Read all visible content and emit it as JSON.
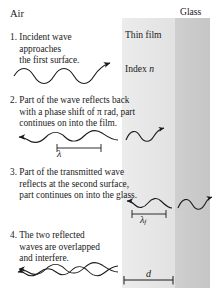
{
  "figure": {
    "title_region": {
      "air_label": "Air",
      "film_label_line1": "Thin film",
      "film_label_line2_prefix": "Index ",
      "film_label_index_symbol": "n",
      "glass_label": "Glass"
    },
    "materials": [
      {
        "name": "air",
        "label": "Air",
        "color": "#ffffff"
      },
      {
        "name": "thin-film",
        "label": "Thin film",
        "color": "#e8e8e8"
      },
      {
        "name": "glass",
        "label": "Glass",
        "color": "#c9c9c9"
      }
    ],
    "steps": [
      {
        "number": "1.",
        "text": "1. Incident wave\n    approaches\n    the first surface."
      },
      {
        "number": "2.",
        "text": "2. Part of the wave reflects back\n    with a phase shift of π rad, part\n    continues on into the film."
      },
      {
        "number": "3.",
        "text": "3. Part of the transmitted wave\n    reflects at the second surface,\n    part continues on into the glass."
      },
      {
        "number": "4.",
        "text": "4. The two reflected\n    waves are overlapped\n    and interfere."
      }
    ],
    "annotations": {
      "wavelength_air": "λ",
      "wavelength_film_base": "λ",
      "wavelength_film_subscript": "f",
      "thickness": "d"
    }
  }
}
